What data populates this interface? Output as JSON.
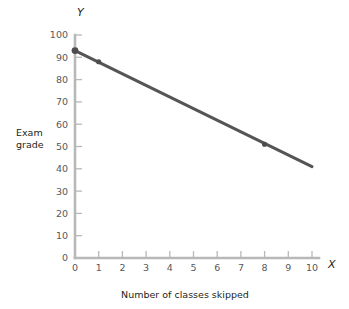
{
  "chart_data": {
    "type": "line",
    "title": "",
    "xlabel": "Number of classes skipped",
    "ylabel": "Exam grade",
    "x_axis_letter": "X",
    "y_axis_letter": "Y",
    "xlim": [
      0,
      10
    ],
    "ylim": [
      0,
      100
    ],
    "xticks": [
      0,
      1,
      2,
      3,
      4,
      5,
      6,
      7,
      8,
      9,
      10
    ],
    "yticks": [
      0,
      10,
      20,
      30,
      40,
      50,
      60,
      70,
      80,
      90,
      100
    ],
    "xtick_labels": [
      "0",
      "1",
      "2",
      "3",
      "4",
      "5",
      "6",
      "7",
      "8",
      "9",
      "10"
    ],
    "ytick_labels": [
      "0",
      "10",
      "20",
      "30",
      "40",
      "50",
      "60",
      "70",
      "80",
      "90",
      "100"
    ],
    "grid": false,
    "legend": false,
    "series": [
      {
        "name": "Exam grade vs classes skipped",
        "line_x": [
          0,
          10
        ],
        "line_y": [
          93,
          41
        ],
        "slope": -5.2,
        "intercept": 93,
        "color": "#555558",
        "markers": [
          {
            "x": 0,
            "y": 93
          },
          {
            "x": 1,
            "y": 88
          },
          {
            "x": 8,
            "y": 51
          }
        ]
      }
    ]
  },
  "style": {
    "axis_color": "#b8b8b8",
    "line_color": "#555558",
    "marker_color": "#4d4d50",
    "text_color": "#231f20",
    "tick_text_color": "#58585b",
    "background": "#ffffff"
  },
  "labels": {
    "y_axis_title_line1": "Exam",
    "y_axis_title_line2": "grade"
  }
}
